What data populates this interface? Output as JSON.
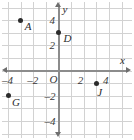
{
  "chart_data": {
    "type": "scatter",
    "title": "",
    "xlabel": "x",
    "ylabel": "y",
    "xlim": [
      -5,
      5
    ],
    "ylim": [
      -5,
      5
    ],
    "grid": true,
    "legend": "none",
    "x_ticks": [
      {
        "value": -4,
        "label": "–4"
      },
      {
        "value": -2,
        "label": "–2"
      },
      {
        "value": 2,
        "label": "2"
      },
      {
        "value": 4,
        "label": "4"
      }
    ],
    "y_ticks": [
      {
        "value": 4,
        "label": "4"
      },
      {
        "value": 2,
        "label": "2"
      },
      {
        "value": -2,
        "label": "–2"
      },
      {
        "value": -4,
        "label": "–4"
      }
    ],
    "origin_label": "O",
    "points": [
      {
        "name": "A",
        "x": -3,
        "y": 4
      },
      {
        "name": "D",
        "x": 0,
        "y": 3
      },
      {
        "name": "G",
        "x": -4,
        "y": -2
      },
      {
        "name": "J",
        "x": 3,
        "y": -1
      }
    ],
    "colors": {
      "point": "#2b2b2b",
      "axis": "#8c8c8c",
      "grid": "#d2d2d2",
      "background": "#ffffff",
      "text": "#2b2b2b"
    }
  }
}
